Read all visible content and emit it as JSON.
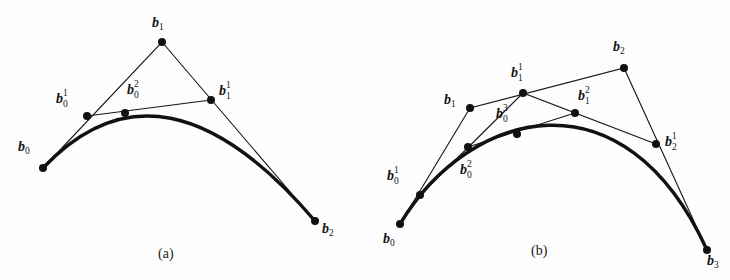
{
  "figure": {
    "background_color": "#fdfdfd",
    "ink_color": "#111111",
    "hull_color": "#171717",
    "captions": [
      {
        "text": "(a)",
        "x": 158,
        "y": 246
      },
      {
        "text": "(b)",
        "x": 531,
        "y": 243
      }
    ],
    "panels": [
      {
        "id": "a",
        "name": "quadratic-bezier-panel",
        "caption": "(a)",
        "degree": 2,
        "points": [
          {
            "name": "b0",
            "sym": "b",
            "sub": "0",
            "sup": "",
            "x": 43,
            "y": 168,
            "label_x": 18,
            "label_y": 140,
            "stacked": false
          },
          {
            "name": "b1",
            "sym": "b",
            "sub": "1",
            "sup": "",
            "x": 162,
            "y": 42,
            "label_x": 152,
            "label_y": 16,
            "stacked": false
          },
          {
            "name": "b2",
            "sym": "b",
            "sub": "2",
            "sup": "",
            "x": 315,
            "y": 221,
            "label_x": 322,
            "label_y": 222,
            "stacked": false
          },
          {
            "name": "b0_1",
            "sym": "b",
            "sub": "0",
            "sup": "1",
            "x": 87,
            "y": 116,
            "label_x": 56,
            "label_y": 92,
            "stacked": true
          },
          {
            "name": "b1_1",
            "sym": "b",
            "sub": "1",
            "sup": "1",
            "x": 211,
            "y": 100,
            "label_x": 219,
            "label_y": 84,
            "stacked": true
          },
          {
            "name": "b0_2",
            "sym": "b",
            "sub": "0",
            "sup": "2",
            "x": 125,
            "y": 113,
            "label_x": 127,
            "label_y": 83,
            "stacked": true
          }
        ],
        "hull_polyline": [
          [
            43,
            168
          ],
          [
            162,
            42
          ],
          [
            315,
            221
          ]
        ],
        "level1_segment": [
          [
            87,
            116
          ],
          [
            211,
            100
          ]
        ],
        "curve": {
          "p0": [
            43,
            168
          ],
          "c1": [
            162,
            42
          ],
          "p1": [
            315,
            221
          ]
        }
      },
      {
        "id": "b",
        "name": "cubic-bezier-panel",
        "caption": "(b)",
        "degree": 3,
        "points": [
          {
            "name": "b0",
            "sym": "b",
            "sub": "0",
            "sup": "",
            "x": 400,
            "y": 224,
            "label_x": 383,
            "label_y": 232,
            "stacked": false
          },
          {
            "name": "b1",
            "sym": "b",
            "sub": "1",
            "sup": "",
            "x": 470,
            "y": 108,
            "label_x": 444,
            "label_y": 93,
            "stacked": false
          },
          {
            "name": "b2",
            "sym": "b",
            "sub": "2",
            "sup": "",
            "x": 624,
            "y": 68,
            "label_x": 613,
            "label_y": 40,
            "stacked": false
          },
          {
            "name": "b3",
            "sym": "b",
            "sub": "3",
            "sup": "",
            "x": 707,
            "y": 250,
            "label_x": 707,
            "label_y": 254,
            "stacked": false
          },
          {
            "name": "b0_1",
            "sym": "b",
            "sub": "0",
            "sup": "1",
            "x": 420,
            "y": 195,
            "label_x": 387,
            "label_y": 169,
            "stacked": true
          },
          {
            "name": "b1_1",
            "sym": "b",
            "sub": "1",
            "sup": "1",
            "x": 523,
            "y": 93,
            "label_x": 511,
            "label_y": 66,
            "stacked": true
          },
          {
            "name": "b2_1",
            "sym": "b",
            "sub": "2",
            "sup": "1",
            "x": 656,
            "y": 144,
            "label_x": 665,
            "label_y": 135,
            "stacked": true
          },
          {
            "name": "b0_2",
            "sym": "b",
            "sub": "0",
            "sup": "2",
            "x": 468,
            "y": 147,
            "label_x": 460,
            "label_y": 163,
            "stacked": true
          },
          {
            "name": "b1_2",
            "sym": "b",
            "sub": "1",
            "sup": "2",
            "x": 575,
            "y": 113,
            "label_x": 578,
            "label_y": 89,
            "stacked": true
          },
          {
            "name": "b0_3",
            "sym": "b",
            "sub": "0",
            "sup": "3",
            "x": 517,
            "y": 134,
            "label_x": 496,
            "label_y": 107,
            "stacked": true
          }
        ],
        "hull_polyline": [
          [
            400,
            224
          ],
          [
            470,
            108
          ],
          [
            624,
            68
          ],
          [
            707,
            250
          ]
        ],
        "level1_polyline": [
          [
            420,
            195
          ],
          [
            523,
            93
          ],
          [
            656,
            144
          ]
        ],
        "level2_segment": [
          [
            468,
            147
          ],
          [
            575,
            113
          ]
        ],
        "curve": {
          "p0": [
            400,
            224
          ],
          "c1": [
            470,
            108
          ],
          "c2": [
            624,
            68
          ],
          "p1": [
            707,
            250
          ]
        }
      }
    ]
  }
}
